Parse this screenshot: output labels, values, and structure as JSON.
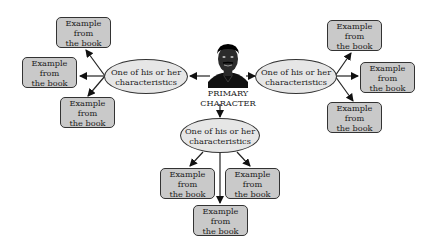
{
  "diagram": {
    "type": "character web / mind map",
    "center": {
      "label_line1": "PRIMARY",
      "label_line2": "CHARACTER",
      "icon": "person-portrait-icon"
    },
    "branches": [
      {
        "position": "left",
        "characteristic": {
          "line1": "One of his or her",
          "line2": "characteristics"
        },
        "examples": [
          {
            "line1": "Example from",
            "line2": "the book"
          },
          {
            "line1": "Example from",
            "line2": "the book"
          },
          {
            "line1": "Example from",
            "line2": "the book"
          }
        ]
      },
      {
        "position": "right",
        "characteristic": {
          "line1": "One of his or her",
          "line2": "characteristics"
        },
        "examples": [
          {
            "line1": "Example from",
            "line2": "the book"
          },
          {
            "line1": "Example from",
            "line2": "the book"
          },
          {
            "line1": "Example from",
            "line2": "the book"
          }
        ]
      },
      {
        "position": "bottom",
        "characteristic": {
          "line1": "One of his or her",
          "line2": "characteristics"
        },
        "examples": [
          {
            "line1": "Example from",
            "line2": "the book"
          },
          {
            "line1": "Example from",
            "line2": "the book"
          },
          {
            "line1": "Example from",
            "line2": "the book"
          }
        ]
      }
    ],
    "colors": {
      "box_fill": "#c9c9c9",
      "ellipse_fill": "#e6e6e6",
      "stroke": "#333333",
      "background": "#ffffff"
    }
  }
}
